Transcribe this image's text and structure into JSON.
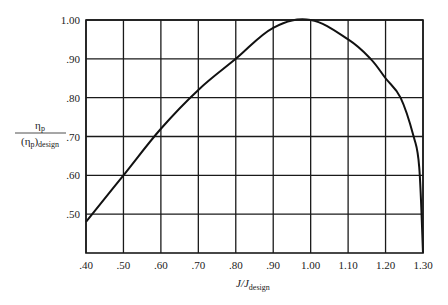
{
  "chart_data": {
    "type": "line",
    "title": "",
    "xlabel": "J/J_design",
    "xlabel_main": "J/J",
    "xlabel_sub": "design",
    "ylabel": "η_p / (η_p)_design",
    "ylabel_num": "η",
    "ylabel_num_sub": "p",
    "ylabel_den_open": "(η",
    "ylabel_den_sub1": "p",
    "ylabel_den_close": ")",
    "ylabel_den_sub2": "design",
    "xlim": [
      0.4,
      1.3
    ],
    "ylim": [
      0.4,
      1.0
    ],
    "grid": true,
    "legend": null,
    "x_ticks": [
      0.4,
      0.5,
      0.6,
      0.7,
      0.8,
      0.9,
      1.0,
      1.1,
      1.2,
      1.3
    ],
    "x_tick_labels": [
      ".40",
      ".50",
      ".60",
      ".70",
      ".80",
      ".90",
      "1.00",
      "1.10",
      "1.20",
      "1.30"
    ],
    "y_ticks": [
      0.5,
      0.6,
      0.7,
      0.8,
      0.9,
      1.0
    ],
    "y_tick_labels": [
      ".50",
      ".60",
      ".70",
      ".80",
      ".90",
      "1.00"
    ],
    "series": [
      {
        "name": "η_p/(η_p)_design",
        "color": "#111111",
        "x": [
          0.4,
          0.5,
          0.6,
          0.7,
          0.8,
          0.9,
          1.0,
          1.1,
          1.16,
          1.2,
          1.24,
          1.275,
          1.29,
          1.3
        ],
        "values": [
          0.48,
          0.6,
          0.72,
          0.82,
          0.9,
          0.98,
          1.0,
          0.95,
          0.9,
          0.85,
          0.8,
          0.7,
          0.62,
          0.4
        ]
      }
    ]
  },
  "layout": {
    "plot_left": 86,
    "plot_right": 423,
    "plot_top": 20,
    "plot_bottom": 253,
    "grid_color": "#1a1a1a",
    "line_color": "#111111"
  }
}
